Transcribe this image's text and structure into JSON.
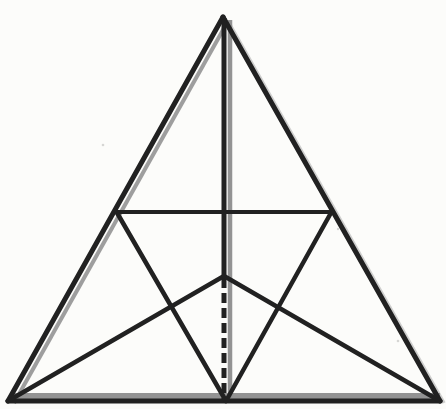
{
  "figure": {
    "canvas": {
      "width": 446,
      "height": 409,
      "background": "#fcfcfa"
    },
    "colors": {
      "ink": "#212121",
      "shadow": "#8d8d8d",
      "shadow_faint": "#b5b5b5",
      "speck": "#d6d6d4"
    },
    "points": {
      "apex": [
        223,
        17
      ],
      "bottom_left": [
        8,
        401
      ],
      "bottom_right": [
        440,
        401
      ],
      "base_mid": [
        226,
        401
      ],
      "left_mid": [
        116,
        211
      ],
      "right_mid": [
        332,
        211
      ],
      "centroid": [
        224,
        276
      ]
    },
    "shadow_lines": [
      {
        "name": "left-side-shadow",
        "x1": 228,
        "y1": 21,
        "x2": 14,
        "y2": 403,
        "width": 4,
        "color": "shadow",
        "opacity": 0.85
      },
      {
        "name": "right-side-shadow",
        "x1": 228,
        "y1": 21,
        "x2": 444,
        "y2": 403,
        "width": 3.5,
        "color": "shadow_faint",
        "opacity": 0.65
      },
      {
        "name": "vertical-median-shadow",
        "x1": 230,
        "y1": 20,
        "x2": 230,
        "y2": 398,
        "width": 4.5,
        "color": "shadow",
        "opacity": 0.95
      },
      {
        "name": "base-shadow",
        "x1": 12,
        "y1": 396,
        "x2": 440,
        "y2": 396,
        "width": 6,
        "color": "shadow",
        "opacity": 0.95
      }
    ],
    "ink_lines": [
      {
        "name": "triangle-side-left",
        "x1": 223,
        "y1": 17,
        "x2": 8,
        "y2": 401,
        "width": 5,
        "color": "ink",
        "cap": "round"
      },
      {
        "name": "triangle-side-right",
        "x1": 223,
        "y1": 17,
        "x2": 440,
        "y2": 401,
        "width": 5,
        "color": "ink",
        "cap": "round"
      },
      {
        "name": "triangle-base",
        "x1": 8,
        "y1": 401,
        "x2": 440,
        "y2": 401,
        "width": 5,
        "color": "ink",
        "cap": "round"
      },
      {
        "name": "vertical-median-solid",
        "x1": 224,
        "y1": 18,
        "x2": 224,
        "y2": 276,
        "width": 5,
        "color": "ink",
        "cap": "butt"
      },
      {
        "name": "vertical-median-dashed",
        "x1": 224,
        "y1": 278,
        "x2": 224,
        "y2": 400,
        "width": 5,
        "color": "ink",
        "cap": "butt",
        "dash": "10 5"
      },
      {
        "name": "midline-horizontal",
        "x1": 116,
        "y1": 212,
        "x2": 332,
        "y2": 212,
        "width": 4,
        "color": "ink",
        "cap": "round"
      },
      {
        "name": "medial-left-to-base-mid",
        "x1": 116,
        "y1": 211,
        "x2": 226,
        "y2": 401,
        "width": 4.5,
        "color": "ink",
        "cap": "round"
      },
      {
        "name": "medial-right-to-base-mid",
        "x1": 332,
        "y1": 211,
        "x2": 226,
        "y2": 401,
        "width": 4.5,
        "color": "ink",
        "cap": "round"
      },
      {
        "name": "left-corner-to-centroid",
        "x1": 8,
        "y1": 401,
        "x2": 224,
        "y2": 276,
        "width": 4.5,
        "color": "ink",
        "cap": "round"
      },
      {
        "name": "right-corner-to-centroid",
        "x1": 440,
        "y1": 401,
        "x2": 224,
        "y2": 276,
        "width": 4.5,
        "color": "ink",
        "cap": "round"
      }
    ],
    "specks": [
      {
        "name": "paper-speck",
        "cx": 103,
        "cy": 145,
        "r": 1.3
      },
      {
        "name": "paper-speck",
        "cx": 338,
        "cy": 229,
        "r": 1.2
      },
      {
        "name": "paper-speck",
        "cx": 398,
        "cy": 341,
        "r": 1.3
      }
    ]
  }
}
